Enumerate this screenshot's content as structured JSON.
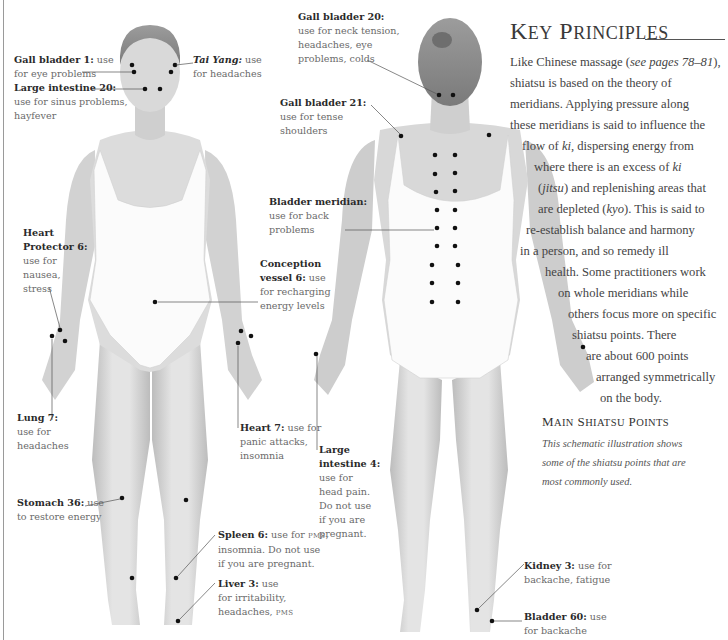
{
  "page": {
    "heading": "Key Principles",
    "heading_first_letters": [
      "K",
      "P"
    ],
    "heading_rest": [
      "EY",
      "RINCIPLES"
    ],
    "body_lines": [
      {
        "parts": [
          {
            "t": "Like Chinese massage ("
          },
          {
            "t": "see pages 78–81",
            "em": true
          },
          {
            "t": "),"
          }
        ],
        "x": 510,
        "y": 52
      },
      {
        "parts": [
          {
            "t": "shiatsu is based on the theory of"
          }
        ],
        "x": 510,
        "y": 73
      },
      {
        "parts": [
          {
            "t": "meridians. Applying pressure along"
          }
        ],
        "x": 510,
        "y": 94
      },
      {
        "parts": [
          {
            "t": "these meridians is said to influence the"
          }
        ],
        "x": 510,
        "y": 115
      },
      {
        "parts": [
          {
            "t": "flow of "
          },
          {
            "t": "ki",
            "em": true
          },
          {
            "t": ", dispersing energy from"
          }
        ],
        "x": 522,
        "y": 136
      },
      {
        "parts": [
          {
            "t": "where there is an excess of "
          },
          {
            "t": "ki",
            "em": true
          }
        ],
        "x": 534,
        "y": 157
      },
      {
        "parts": [
          {
            "t": "("
          },
          {
            "t": "jitsu",
            "em": true
          },
          {
            "t": ") and replenishing areas that"
          }
        ],
        "x": 538,
        "y": 178
      },
      {
        "parts": [
          {
            "t": "are depleted ("
          },
          {
            "t": "kyo",
            "em": true
          },
          {
            "t": "). This is said to"
          }
        ],
        "x": 538,
        "y": 199
      },
      {
        "parts": [
          {
            "t": "re-establish balance and harmony"
          }
        ],
        "x": 526,
        "y": 220
      },
      {
        "parts": [
          {
            "t": "in a person, and so remedy ill"
          }
        ],
        "x": 520,
        "y": 241
      },
      {
        "parts": [
          {
            "t": "health. Some practitioners work"
          }
        ],
        "x": 545,
        "y": 262
      },
      {
        "parts": [
          {
            "t": "on whole meridians while"
          }
        ],
        "x": 558,
        "y": 283
      },
      {
        "parts": [
          {
            "t": "others focus more on specific"
          }
        ],
        "x": 568,
        "y": 304
      },
      {
        "parts": [
          {
            "t": "shiatsu points. There"
          }
        ],
        "x": 572,
        "y": 325
      },
      {
        "parts": [
          {
            "t": "are about 600 points"
          }
        ],
        "x": 586,
        "y": 346
      },
      {
        "parts": [
          {
            "t": "arranged symmetrically"
          }
        ],
        "x": 596,
        "y": 367
      },
      {
        "parts": [
          {
            "t": "on the body."
          }
        ],
        "x": 600,
        "y": 388
      }
    ],
    "section_title": "Main Shiatsu Points",
    "caption_lines": [
      "This schematic illustration shows",
      "some of the shiatsu points that are",
      "most commonly used."
    ]
  },
  "points": [
    {
      "id": "gall-bladder-1",
      "name": "Gall bladder 1:",
      "desc": " use|for eye problems",
      "x": 14,
      "y": 53
    },
    {
      "id": "tai-yang",
      "name": "Tai Yang:",
      "italic": true,
      "desc": " use|for headaches",
      "x": 193,
      "y": 53
    },
    {
      "id": "large-intestine-20",
      "name": "Large intestine 20:",
      "desc": "|use for sinus problems,|hayfever",
      "x": 14,
      "y": 81
    },
    {
      "id": "gall-bladder-20",
      "name": "Gall bladder 20:",
      "desc": "|use for neck tension,|headaches, eye|problems, colds",
      "x": 298,
      "y": 10
    },
    {
      "id": "gall-bladder-21",
      "name": "Gall bladder 21:",
      "desc": "|use for tense|shoulders",
      "x": 280,
      "y": 96
    },
    {
      "id": "bladder-meridian",
      "name": "Bladder meridian:",
      "desc": "|use for back|problems",
      "x": 269,
      "y": 195
    },
    {
      "id": "conception-vessel-6",
      "name": "Conception|vessel 6:",
      "desc": " use|for recharging|energy levels",
      "x": 260,
      "y": 257
    },
    {
      "id": "heart-protector-6",
      "name": "Heart|Protector 6:",
      "desc": "|use for|nausea,|stress",
      "x": 23,
      "y": 226
    },
    {
      "id": "lung-7",
      "name": "Lung 7:",
      "desc": "|use for|headaches",
      "x": 17,
      "y": 411
    },
    {
      "id": "heart-7",
      "name": "Heart 7:",
      "desc": " use for|panic attacks,|insomnia",
      "x": 240,
      "y": 421
    },
    {
      "id": "large-intestine-4",
      "name": "Large|intestine 4:",
      "desc": "|use for|head pain.|Do not use|if you are|pregnant.",
      "x": 319,
      "y": 443
    },
    {
      "id": "stomach-36",
      "name": "Stomach 36:",
      "desc": " use|to restore energy",
      "x": 17,
      "y": 496
    },
    {
      "id": "spleen-6",
      "name": "Spleen 6:",
      "desc": " use for PMS,|insomnia. Do not use|if you are pregnant.",
      "x": 218,
      "y": 528
    },
    {
      "id": "liver-3",
      "name": "Liver 3:",
      "desc": " use|for irritability,|headaches, PMS",
      "x": 218,
      "y": 577
    },
    {
      "id": "kidney-3",
      "name": "Kidney 3:",
      "desc": " use for|backache, fatigue",
      "x": 524,
      "y": 559
    },
    {
      "id": "bladder-60",
      "name": "Bladder 60:",
      "desc": " use|for backache",
      "x": 524,
      "y": 610
    }
  ],
  "colors": {
    "text_label_name": "#2a2a2a",
    "text_label_desc": "#6a6a6a",
    "dot": "#111111",
    "leader": "#555555",
    "skin_light": "#e6e6e6",
    "skin_dark": "#b8b8b8",
    "swimsuit": "#fbfbfb"
  }
}
